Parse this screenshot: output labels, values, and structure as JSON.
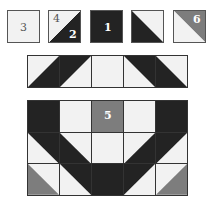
{
  "colors": {
    "white": "#f2f2f2",
    "dark": "#232323",
    "gray": "#7d7d7d",
    "line": "#333333"
  },
  "key_tiles": [
    {
      "id": "tile-3",
      "labels": [
        "3"
      ],
      "type": "solid-white"
    },
    {
      "id": "tile-4-2",
      "labels": [
        "4",
        "2"
      ],
      "type": "half-white-upper-left-dark-lower-right"
    },
    {
      "id": "tile-1",
      "labels": [
        "1"
      ],
      "type": "solid-dark"
    },
    {
      "id": "tile-white-dark",
      "labels": [],
      "type": "half-white-upper-right-dark-lower-left"
    },
    {
      "id": "tile-6",
      "labels": [
        "6"
      ],
      "type": "half-gray-upper-right-white-lower-left"
    }
  ],
  "key": {
    "t1_label": "3",
    "t2_label_a": "4",
    "t2_label_b": "2",
    "t3_label": "1",
    "t5_label": "6"
  },
  "strip": {
    "cells": [
      "white-with-dark-lower-right",
      "dark-upper-left",
      "white",
      "dark-upper-right",
      "white-with-dark-lower-left"
    ]
  },
  "block": {
    "center_label": "5",
    "rows": [
      [
        "dark",
        "white",
        "gray-5",
        "white",
        "dark"
      ],
      [
        "dark-upper-right",
        "dark-lower-left",
        "white",
        "dark-lower-right",
        "dark-upper-left"
      ],
      [
        "gray-lower-left",
        "dark-upper-right",
        "dark",
        "dark-upper-left",
        "gray-lower-right"
      ]
    ]
  }
}
